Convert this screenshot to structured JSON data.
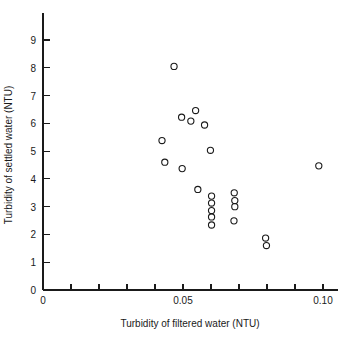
{
  "chart_data": {
    "type": "scatter",
    "title": "",
    "xlabel": "Turbidity of filtered water (NTU)",
    "ylabel": "Turbidity of settled water (NTU)",
    "xlim": [
      0,
      0.105
    ],
    "ylim": [
      0,
      9.6
    ],
    "grid": false,
    "legend": null,
    "marker": "open-circle",
    "x_ticks": [
      0,
      0.01,
      0.02,
      0.03,
      0.04,
      0.05,
      0.06,
      0.07,
      0.08,
      0.09,
      0.1
    ],
    "x_tick_labels": [
      "0",
      "",
      "",
      "",
      "",
      "0.05",
      "",
      "",
      "",
      "",
      "0.10"
    ],
    "y_ticks": [
      0,
      1,
      2,
      3,
      4,
      5,
      6,
      7,
      8,
      9
    ],
    "y_tick_labels": [
      "0",
      "1",
      "2",
      "3",
      "4",
      "5",
      "6",
      "7",
      "8",
      "9"
    ],
    "x": [
      0.0468,
      0.0425,
      0.0435,
      0.0495,
      0.0497,
      0.0528,
      0.0545,
      0.0543,
      0.0577,
      0.0598,
      0.0553,
      0.0602,
      0.0602,
      0.0602,
      0.0602,
      0.0602,
      0.0683,
      0.0685,
      0.0685,
      0.0682,
      0.0795,
      0.0798,
      0.0985
    ],
    "y": [
      8.05,
      5.38,
      4.6,
      6.22,
      4.37,
      6.08,
      6.46,
      6.46,
      5.94,
      5.03,
      3.62,
      3.38,
      3.13,
      2.86,
      2.63,
      2.34,
      3.5,
      3.22,
      3.0,
      2.49,
      1.87,
      1.6,
      4.47
    ],
    "points": [
      {
        "x": 0.0468,
        "y": 8.05
      },
      {
        "x": 0.0425,
        "y": 5.38
      },
      {
        "x": 0.0435,
        "y": 4.6
      },
      {
        "x": 0.0495,
        "y": 6.22
      },
      {
        "x": 0.0497,
        "y": 4.37
      },
      {
        "x": 0.0528,
        "y": 6.08
      },
      {
        "x": 0.0545,
        "y": 6.46
      },
      {
        "x": 0.0577,
        "y": 5.94
      },
      {
        "x": 0.0598,
        "y": 5.03
      },
      {
        "x": 0.0553,
        "y": 3.62
      },
      {
        "x": 0.0602,
        "y": 3.38
      },
      {
        "x": 0.0602,
        "y": 3.13
      },
      {
        "x": 0.0602,
        "y": 2.86
      },
      {
        "x": 0.0602,
        "y": 2.63
      },
      {
        "x": 0.0602,
        "y": 2.34
      },
      {
        "x": 0.0683,
        "y": 3.5
      },
      {
        "x": 0.0685,
        "y": 3.22
      },
      {
        "x": 0.0685,
        "y": 3.0
      },
      {
        "x": 0.0682,
        "y": 2.49
      },
      {
        "x": 0.0795,
        "y": 1.87
      },
      {
        "x": 0.0798,
        "y": 1.6
      },
      {
        "x": 0.0985,
        "y": 4.47
      }
    ],
    "n_points": 22,
    "colors": {
      "marker_stroke": "#1a1a1a",
      "axis": "#1a1a1a",
      "background": "#ffffff"
    }
  }
}
